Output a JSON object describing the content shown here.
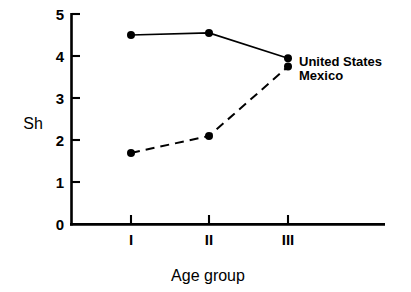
{
  "chart_data": {
    "type": "line",
    "title": "",
    "subtitle": "",
    "xlabel": "Age group",
    "ylabel": "Sh",
    "categories": [
      "I",
      "II",
      "III"
    ],
    "x": [
      1,
      2,
      3
    ],
    "xlim": [
      0.4,
      3.6
    ],
    "ylim": [
      0,
      5
    ],
    "yticks": [
      0,
      1,
      2,
      3,
      4,
      5
    ],
    "ytick_labels": [
      "0",
      "1",
      "2",
      "3",
      "4",
      "5"
    ],
    "xtick_labels": [
      "I",
      "II",
      "III"
    ],
    "grid": false,
    "legend_position": "right-inline-at-last-point",
    "series": [
      {
        "name": "United States",
        "label": "United States",
        "style": "solid",
        "marker": "filled-circle",
        "color": "#000000",
        "values": [
          4.5,
          4.55,
          3.95
        ]
      },
      {
        "name": "Mexico",
        "label": "Mexico",
        "style": "dashed",
        "marker": "filled-circle",
        "color": "#000000",
        "values": [
          1.7,
          2.1,
          3.75
        ]
      }
    ],
    "annotations": []
  },
  "labels": {
    "y_axis_title": "Sh",
    "x_axis_title": "Age group",
    "series_us": "United States",
    "series_mx": "Mexico",
    "ytick_0": "0",
    "ytick_1": "1",
    "ytick_2": "2",
    "ytick_3": "3",
    "ytick_4": "4",
    "ytick_5": "5",
    "xtick_1": "I",
    "xtick_2": "II",
    "xtick_3": "III"
  },
  "colors": {
    "ink": "#000000",
    "background": "#ffffff"
  }
}
